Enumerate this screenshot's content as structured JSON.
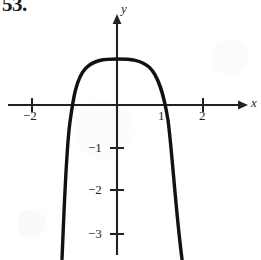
{
  "exercise": {
    "number": "53."
  },
  "figure": {
    "axes": {
      "x_axis_label": "x",
      "y_axis_label": "y",
      "origin_px": {
        "x": 117,
        "y": 105
      },
      "unit_px": 43,
      "x_axis_y_px": 105,
      "y_axis_x_px": 117,
      "x_ticks": [
        {
          "label": "−2",
          "value": -2,
          "px": 32
        },
        {
          "label": "1",
          "value": 1,
          "px": 160
        },
        {
          "label": "2",
          "value": 2,
          "px": 203
        }
      ],
      "y_ticks": [
        {
          "label": "−1",
          "value": -1,
          "px": 148
        },
        {
          "label": "−2",
          "value": -2,
          "px": 190
        },
        {
          "label": "−3",
          "value": -3,
          "px": 234
        }
      ],
      "x_arrow": true,
      "y_arrow": true,
      "axis_color": "#222222"
    },
    "curve": {
      "name": "plateau-curve",
      "color": "#111111",
      "stroke_width": 3.4,
      "description": "Flat-topped plateau near y = 1 between x ≈ -0.9 and x ≈ 0.95, with steep symmetric branches plunging off the bottom of the frame",
      "path": "M 62 259 C 64 215, 66 150, 70 122 C 73 100, 76 78, 86 68 C 94 60, 104 59, 117 59 C 131 59, 141 60, 149 67 C 159 76, 164 96, 168 120 C 172 150, 176 214, 182 259"
    }
  },
  "chart_data": {
    "type": "line",
    "title": "",
    "xlabel": "x",
    "ylabel": "y",
    "xlim": [
      -2.7,
      3.0
    ],
    "ylim": [
      -3.6,
      1.5
    ],
    "grid": false,
    "legend": null,
    "xticks": [
      -2,
      1,
      2
    ],
    "xticklabels": [
      "−2",
      "1",
      "2"
    ],
    "yticks": [
      -1,
      -2,
      -3
    ],
    "yticklabels": [
      "−1",
      "−2",
      "−3"
    ],
    "series": [
      {
        "name": "curve",
        "x": [
          -1.28,
          -1.22,
          -1.16,
          -1.09,
          -1.02,
          -0.95,
          -0.86,
          -0.72,
          -0.54,
          -0.3,
          0.0,
          0.3,
          0.54,
          0.72,
          0.86,
          0.95,
          1.02,
          1.09,
          1.16,
          1.22,
          1.28,
          1.34,
          1.4,
          1.46,
          1.52
        ],
        "y": [
          -3.6,
          -3.0,
          -2.4,
          -1.8,
          -1.2,
          -0.6,
          0.1,
          0.7,
          1.02,
          1.07,
          1.07,
          1.07,
          1.02,
          0.92,
          0.62,
          0.2,
          -0.35,
          -0.95,
          -1.55,
          -2.1,
          -2.65,
          -3.05,
          -3.3,
          -3.48,
          -3.6
        ]
      }
    ]
  }
}
